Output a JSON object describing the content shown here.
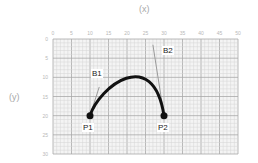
{
  "axes": {
    "x_title": "(x)",
    "y_title": "(y)",
    "x_ticks": [
      "0",
      "5",
      "10",
      "15",
      "20",
      "25",
      "30",
      "35",
      "40",
      "45",
      "50"
    ],
    "y_ticks": [
      "0",
      "5",
      "10",
      "15",
      "20",
      "25",
      "30"
    ],
    "x_range": [
      0,
      50
    ],
    "y_range": [
      0,
      30
    ]
  },
  "points": {
    "P1": {
      "label": "P1",
      "x": 10,
      "y": 20
    },
    "P2": {
      "label": "P2",
      "x": 30,
      "y": 20
    },
    "B1": {
      "label": "B1",
      "x": 12.5,
      "y": 12.5
    },
    "B2": {
      "label": "B2",
      "x": 27,
      "y": 1.5
    }
  },
  "colors": {
    "grid_minor": "#d4d4d4",
    "grid_major": "#a8a8a8",
    "curve": "#111111",
    "handle": "#9a9a9a"
  }
}
